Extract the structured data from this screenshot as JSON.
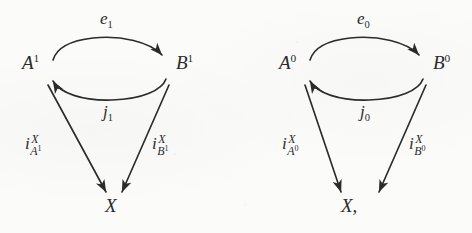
{
  "document": {
    "kind": "scanned-math-diagram",
    "ink_color": "#2b2b2b",
    "paper_color": "#fbfbfa"
  },
  "diagrams": [
    {
      "id": "left",
      "name": "diagram-level-1",
      "nodes": {
        "top_left": {
          "base": "A",
          "sup": "1"
        },
        "top_right": {
          "base": "B",
          "sup": "1"
        },
        "bottom": {
          "base": "X",
          "sup": "",
          "trailing": ""
        }
      },
      "edges": {
        "top_arc": {
          "base": "e",
          "sub": "1",
          "direction": "A-to-B"
        },
        "bottom_arc": {
          "base": "j",
          "sub": "1",
          "direction": "B-to-A"
        },
        "left_diag": {
          "base": "i",
          "sup": "X",
          "sub_base": "A",
          "sub_sup": "1",
          "direction": "A-to-X"
        },
        "right_diag": {
          "base": "i",
          "sup": "X",
          "sub_base": "B",
          "sub_sup": "1",
          "direction": "B-to-X"
        }
      }
    },
    {
      "id": "right",
      "name": "diagram-level-0",
      "nodes": {
        "top_left": {
          "base": "A",
          "sup": "0"
        },
        "top_right": {
          "base": "B",
          "sup": "0"
        },
        "bottom": {
          "base": "X",
          "sup": "",
          "trailing": ","
        }
      },
      "edges": {
        "top_arc": {
          "base": "e",
          "sub": "0",
          "direction": "A-to-B"
        },
        "bottom_arc": {
          "base": "j",
          "sub": "0",
          "direction": "B-to-A"
        },
        "left_diag": {
          "base": "i",
          "sup": "X",
          "sub_base": "A",
          "sub_sup": "0",
          "direction": "A-to-X"
        },
        "right_diag": {
          "base": "i",
          "sup": "X",
          "sub_base": "B",
          "sub_sup": "0",
          "direction": "B-to-X"
        }
      }
    }
  ]
}
